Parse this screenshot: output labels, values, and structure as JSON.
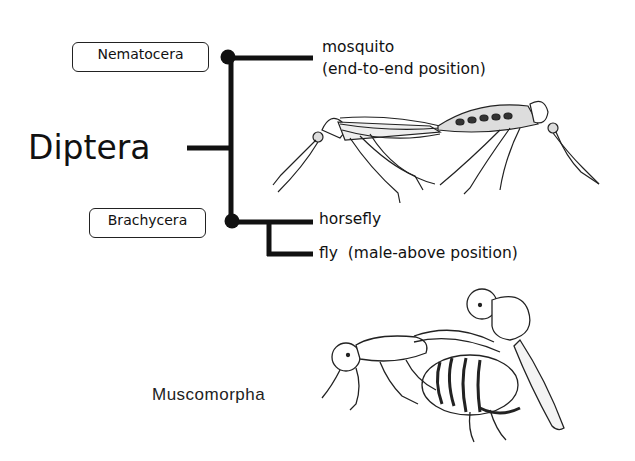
{
  "title": "Diptera",
  "groups": [
    {
      "name": "Nematocera",
      "children": [
        {
          "label": "mosquito",
          "note": "(end-to-end position)"
        }
      ]
    },
    {
      "name": "Brachycera",
      "children": [
        {
          "label": "horsefly"
        },
        {
          "label": "fly  (male-above position)"
        }
      ]
    }
  ],
  "subgroup_label": "Muscomorpha",
  "illustrations": [
    {
      "name": "mosquito-pair",
      "description": "mating mosquitoes, end-to-end"
    },
    {
      "name": "fly-pair",
      "description": "mating flies, male above"
    }
  ],
  "colors": {
    "line": "#111111",
    "background": "#ffffff"
  }
}
